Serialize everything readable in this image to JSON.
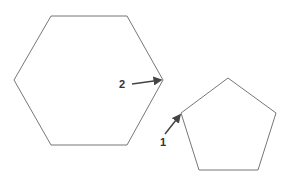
{
  "diagram": {
    "shapes": [
      {
        "id": "hexagon",
        "type": "hexagon",
        "points": "51,16 127,16 163,80 127,145 51,145 14,80",
        "stroke": "#777777"
      },
      {
        "id": "pentagon",
        "type": "pentagon",
        "points": "228,78 276,113 258,170 199,170 181,113",
        "stroke": "#777777"
      }
    ],
    "labels": [
      {
        "id": "label-1",
        "text": "1",
        "x": 160,
        "y": 146,
        "target": "pentagon left vertex",
        "arrow": {
          "x1": 165,
          "y1": 134,
          "x2": 180,
          "y2": 115
        }
      },
      {
        "id": "label-2",
        "text": "2",
        "x": 119,
        "y": 88,
        "target": "hexagon right vertex",
        "arrow": {
          "x1": 132,
          "y1": 84,
          "x2": 161,
          "y2": 80
        }
      }
    ],
    "colors": {
      "stroke": "#777777",
      "arrow": "#444444",
      "text": "#333333",
      "background": "#ffffff"
    }
  }
}
